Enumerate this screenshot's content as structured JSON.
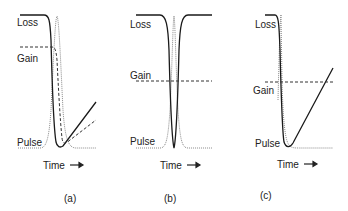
{
  "figure": {
    "panels": [
      {
        "id": "a",
        "caption": "(a)",
        "labels": {
          "loss": "Loss",
          "gain": "Gain",
          "pulse": "Pulse",
          "time": "Time"
        },
        "description": "Loss saturates and recovers slowly; gain depletes during pulse and recovers (dashed) slower than loss"
      },
      {
        "id": "b",
        "caption": "(b)",
        "labels": {
          "loss": "Loss",
          "gain": "Gain",
          "pulse": "Pulse",
          "time": "Time"
        },
        "description": "Fast saturable loss dips symmetrically during pulse; gain constant (dashed horizontal)"
      },
      {
        "id": "c",
        "caption": "(c)",
        "labels": {
          "loss": "Loss",
          "gain": "Gain",
          "pulse": "Pulse",
          "time": "Time"
        },
        "description": "Loss saturated by pulse and recovers linearly above constant gain level (dashed)"
      }
    ],
    "legend_styles": {
      "loss": "solid dark line",
      "gain": "dashed line",
      "pulse": "dotted grey line"
    },
    "colors": {
      "loss": "#1a1a1a",
      "gain": "#333333",
      "pulse": "#8a8a8a",
      "text": "#222222"
    }
  }
}
